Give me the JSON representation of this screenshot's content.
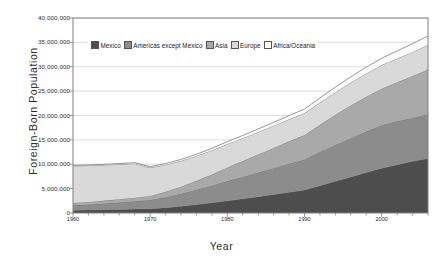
{
  "chart_data": {
    "type": "area",
    "stacked": true,
    "title": "",
    "xlabel": "Year",
    "ylabel": "Foreign-Born Population",
    "xlim": [
      1960,
      2006
    ],
    "ylim": [
      0,
      40000000
    ],
    "grid": true,
    "grid_axis": "y",
    "legend_position": "top-inside",
    "x": [
      1960,
      1962,
      1964,
      1966,
      1968,
      1970,
      1972,
      1974,
      1976,
      1978,
      1980,
      1982,
      1984,
      1986,
      1988,
      1990,
      1992,
      1994,
      1996,
      1998,
      2000,
      2002,
      2004,
      2006
    ],
    "ytick_labels": [
      "0",
      "5,000,000",
      "10,000,000",
      "15,000,000",
      "20,000,000",
      "25,000,000",
      "30,000,000",
      "35,000,000",
      "40,000,000"
    ],
    "ytick_values": [
      0,
      5000000,
      10000000,
      15000000,
      20000000,
      25000000,
      30000000,
      35000000,
      40000000
    ],
    "xtick_labels": [
      "1960",
      "1970",
      "1980",
      "1990",
      "2000"
    ],
    "xtick_values": [
      1960,
      1970,
      1980,
      1990,
      2000
    ],
    "series": [
      {
        "name": "Mexico",
        "color": "#4d4d4d",
        "values": [
          580000,
          620000,
          680000,
          740000,
          800000,
          880000,
          1100000,
          1400000,
          1750000,
          2100000,
          2500000,
          2900000,
          3350000,
          3800000,
          4250000,
          4700000,
          5600000,
          6500000,
          7400000,
          8300000,
          9200000,
          9900000,
          10600000,
          11200000
        ]
      },
      {
        "name": "Americas except Mexico",
        "color": "#8c8c8c",
        "values": [
          1000000,
          1120000,
          1260000,
          1420000,
          1600000,
          1800000,
          2150000,
          2550000,
          3000000,
          3500000,
          4050000,
          4500000,
          4950000,
          5400000,
          5850000,
          6300000,
          6900000,
          7450000,
          7950000,
          8400000,
          8800000,
          8900000,
          8900000,
          9050000
        ]
      },
      {
        "name": "Asia",
        "color": "#a9a9a9",
        "values": [
          490000,
          540000,
          600000,
          670000,
          750000,
          830000,
          1100000,
          1450000,
          1850000,
          2300000,
          2800000,
          3250000,
          3700000,
          4150000,
          4600000,
          5000000,
          5600000,
          6200000,
          6700000,
          7150000,
          7500000,
          8000000,
          8600000,
          9200000
        ]
      },
      {
        "name": "Europe",
        "color": "#d9d9d9",
        "values": [
          7600000,
          7450000,
          7300000,
          7150000,
          7000000,
          5800000,
          5550000,
          5300000,
          5100000,
          4950000,
          4800000,
          4700000,
          4620000,
          4560000,
          4520000,
          4500000,
          4550000,
          4620000,
          4700000,
          4780000,
          4850000,
          4900000,
          4950000,
          5000000
        ]
      },
      {
        "name": "Africa/Oceania",
        "color": "#fbfbfb",
        "values": [
          120000,
          130000,
          145000,
          160000,
          180000,
          200000,
          240000,
          290000,
          350000,
          420000,
          500000,
          560000,
          620000,
          690000,
          760000,
          830000,
          950000,
          1070000,
          1180000,
          1290000,
          1400000,
          1550000,
          1700000,
          1850000
        ]
      }
    ],
    "totals_note": "",
    "axis_color": "#808080",
    "grid_color": "#c8c8c8",
    "text_color": "#2b2b2b"
  },
  "legend": {
    "items": [
      {
        "label": "Mexico"
      },
      {
        "label": "Americas except Mexico"
      },
      {
        "label": "Asia"
      },
      {
        "label": "Europe"
      },
      {
        "label": "Africa/Oceania"
      }
    ]
  }
}
